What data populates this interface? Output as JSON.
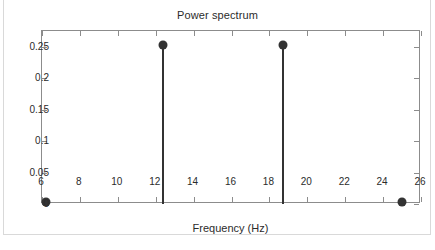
{
  "figure": {
    "title": "Power spectrum"
  },
  "chart_data": {
    "type": "bar",
    "title": "Power spectrum",
    "xlabel": "Frequency (Hz)",
    "ylabel": "",
    "xlim": [
      6,
      26
    ],
    "ylim": [
      0,
      0.275
    ],
    "grid": false,
    "legend": null,
    "xticks": [
      6,
      8,
      10,
      12,
      14,
      16,
      18,
      20,
      22,
      24,
      26
    ],
    "xticklabels": [
      "6",
      "8",
      "10",
      "12",
      "14",
      "16",
      "18",
      "20",
      "22",
      "24",
      "26"
    ],
    "yticks": [
      0,
      0.05,
      0.1,
      0.15,
      0.2,
      0.25
    ],
    "yticklabels": [
      "0",
      "0.05",
      "0.1",
      "0.15",
      "0.2",
      "0.25"
    ],
    "marker_style": "filled-circle",
    "stem_color": "#333333",
    "axis_color": "#8c8c8c",
    "x": [
      6.2,
      12.4,
      18.7,
      25.0
    ],
    "values": [
      0,
      0.25,
      0.25,
      0
    ],
    "points": [
      {
        "frequency": 6.2,
        "power": 0
      },
      {
        "frequency": 12.4,
        "power": 0.25
      },
      {
        "frequency": 18.7,
        "power": 0.25
      },
      {
        "frequency": 25.0,
        "power": 0
      }
    ]
  }
}
